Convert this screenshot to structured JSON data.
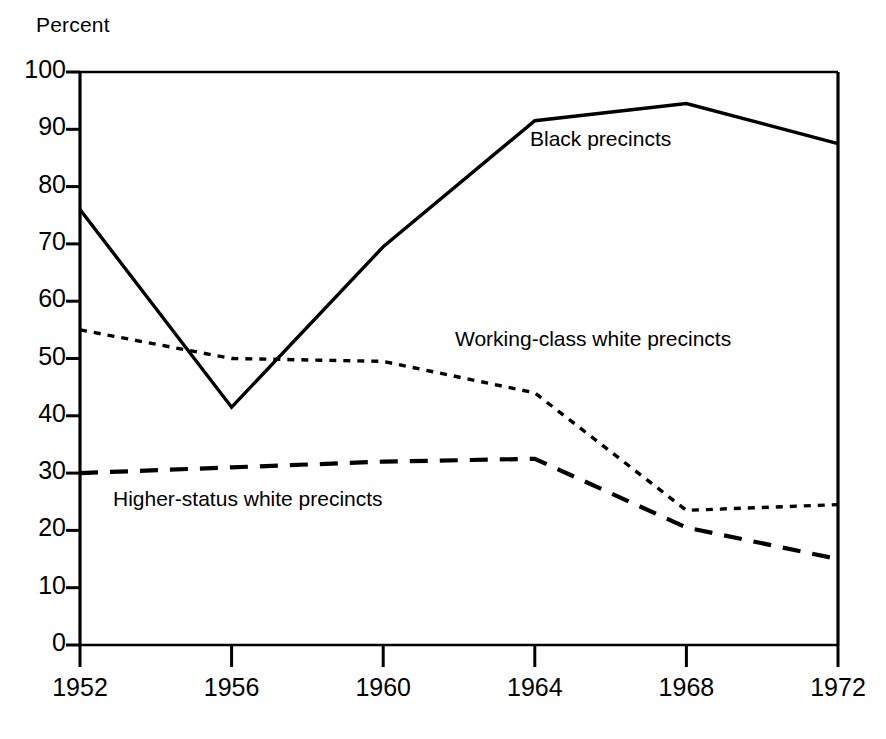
{
  "chart_data": {
    "type": "line",
    "title": "",
    "ylabel": "Percent",
    "xlabel": "",
    "x": [
      1952,
      1956,
      1960,
      1964,
      1968,
      1972
    ],
    "xtick_labels": [
      "1952",
      "1956",
      "1960",
      "1964",
      "1968",
      "1972"
    ],
    "ytick_labels": [
      "0",
      "10",
      "20",
      "30",
      "40",
      "50",
      "60",
      "70",
      "80",
      "90",
      "100"
    ],
    "yticks": [
      0,
      10,
      20,
      30,
      40,
      50,
      60,
      70,
      80,
      90,
      100
    ],
    "ylim": [
      0,
      100
    ],
    "xlim": [
      1952,
      1972
    ],
    "grid": false,
    "legend_position": "inline-annotations",
    "series": [
      {
        "name": "Black precincts",
        "label": "Black precincts",
        "linestyle": "solid",
        "color": "#000000",
        "values": [
          76,
          41.5,
          69.5,
          91.5,
          94.5,
          87.5
        ]
      },
      {
        "name": "Working-class white precincts",
        "label": "Working-class white precincts",
        "linestyle": "dotted",
        "color": "#000000",
        "values": [
          55,
          50,
          49.5,
          44,
          23.5,
          24.5
        ]
      },
      {
        "name": "Higher-status white precincts",
        "label": "Higher-status white precincts",
        "linestyle": "dashed",
        "color": "#000000",
        "values": [
          30,
          31,
          32,
          32.5,
          20.5,
          15
        ]
      }
    ]
  },
  "axis": {
    "percent_label": "Percent"
  }
}
